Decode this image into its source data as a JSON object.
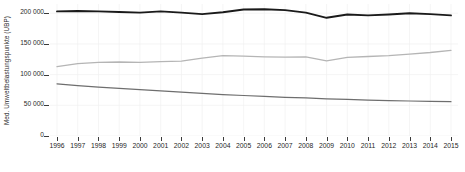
{
  "chart_data": {
    "type": "line",
    "title": "",
    "subtitle": "",
    "xlabel": "",
    "ylabel": "Med. Umweltbelastungspunkte (UBP)",
    "grid": true,
    "legend": "none",
    "background_color": "#ffffff",
    "xlim": [
      1996,
      2015
    ],
    "ylim": [
      0,
      215000
    ],
    "x": [
      1996,
      1997,
      1998,
      1999,
      2000,
      2001,
      2002,
      2003,
      2004,
      2005,
      2006,
      2007,
      2008,
      2009,
      2010,
      2011,
      2012,
      2013,
      2014,
      2015
    ],
    "xticklabels": [
      "1996",
      "1997",
      "1998",
      "1999",
      "2000",
      "2001",
      "2002",
      "2003",
      "2004",
      "2005",
      "2006",
      "2007",
      "2008",
      "2009",
      "2010",
      "2011",
      "2012",
      "2013",
      "2014",
      "2015"
    ],
    "yticks": [
      0,
      50000,
      100000,
      150000,
      200000
    ],
    "yticklabels": [
      "0",
      "50 000",
      "100 000",
      "150 000",
      "200 000"
    ],
    "series": [
      {
        "name": "series-top",
        "color": "#1a1a1a",
        "width": 1.9,
        "values": [
          203000,
          203500,
          203000,
          202000,
          201000,
          203000,
          201000,
          198500,
          201500,
          206000,
          206500,
          205000,
          201000,
          192500,
          198000,
          196500,
          198000,
          200000,
          198500,
          196500
        ]
      },
      {
        "name": "series-middle",
        "color": "#b5b5b5",
        "width": 1.3,
        "values": [
          113000,
          118000,
          120000,
          120500,
          120000,
          121000,
          122000,
          127000,
          131000,
          130000,
          129000,
          128500,
          129000,
          122500,
          128000,
          129500,
          131000,
          133500,
          136000,
          139500
        ]
      },
      {
        "name": "series-bottom",
        "color": "#6e6e6e",
        "width": 1.2,
        "values": [
          85000,
          82000,
          79500,
          77500,
          75500,
          73500,
          71500,
          69500,
          67500,
          66000,
          64500,
          63000,
          62000,
          60500,
          59500,
          58500,
          57500,
          57000,
          56500,
          56000
        ]
      }
    ]
  }
}
